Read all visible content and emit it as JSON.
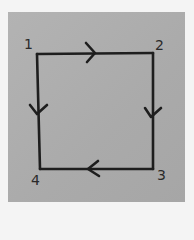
{
  "diagram": {
    "type": "directed-cycle",
    "nodes": [
      {
        "id": "1",
        "label": "1",
        "x": 37,
        "y": 53
      },
      {
        "id": "2",
        "label": "2",
        "x": 153,
        "y": 53
      },
      {
        "id": "3",
        "label": "3",
        "x": 153,
        "y": 169
      },
      {
        "id": "4",
        "label": "4",
        "x": 40,
        "y": 169
      }
    ],
    "edges": [
      {
        "from": "1",
        "to": "2",
        "direction": "right"
      },
      {
        "from": "2",
        "to": "3",
        "direction": "down"
      },
      {
        "from": "3",
        "to": "4",
        "direction": "left"
      },
      {
        "from": "1",
        "to": "4",
        "direction": "down"
      }
    ],
    "colors": {
      "paper": "#adadad",
      "ink": "#1e1e1e",
      "background": "#f4f4f4"
    }
  }
}
